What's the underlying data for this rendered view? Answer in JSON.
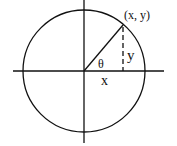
{
  "diagram": {
    "type": "unit-circle",
    "labels": {
      "point": "(x, y)",
      "angle": "θ",
      "x": "x",
      "y": "y"
    },
    "colors": {
      "stroke": "#111111",
      "background": "#ffffff"
    }
  }
}
